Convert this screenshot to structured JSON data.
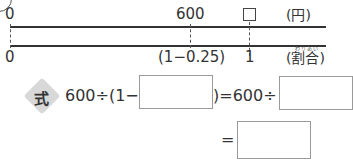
{
  "diagram": {
    "top_axis": {
      "left_label": "0",
      "mid_label": "600",
      "unknown_marker": "□",
      "unit_label": "(円)"
    },
    "bottom_axis": {
      "left_label": "0",
      "mid_label": "(1−0.25)",
      "right_label": "1",
      "unit_label": "(割合)",
      "unit_ruby": "わりあい"
    }
  },
  "equation": {
    "badge": "式",
    "line1_part1": "600÷(1−",
    "line1_part2": ")=600÷",
    "line2_equals": "=",
    "answer_boxes": [
      "",
      "",
      ""
    ]
  }
}
